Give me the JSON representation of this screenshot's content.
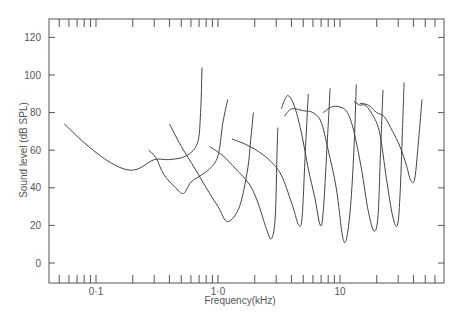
{
  "chart_data": {
    "type": "line",
    "title": "",
    "xlabel": "Frequency(kHz)",
    "ylabel": "Sound level (dB SPL)",
    "xscale": "log",
    "xlim": [
      0.045,
      60
    ],
    "ylim": [
      -10,
      130
    ],
    "x_tick_labels": [
      {
        "value": 0.1,
        "label": "0·1"
      },
      {
        "value": 1.0,
        "label": "1·0"
      },
      {
        "value": 10,
        "label": "10"
      }
    ],
    "y_ticks": [
      0,
      20,
      40,
      60,
      80,
      100,
      120
    ],
    "grid": false,
    "legend": null,
    "series": [
      {
        "name": "tuning-curve-1",
        "points": [
          [
            0.055,
            74
          ],
          [
            0.08,
            64
          ],
          [
            0.12,
            55
          ],
          [
            0.17,
            50
          ],
          [
            0.22,
            50
          ],
          [
            0.3,
            55
          ],
          [
            0.4,
            55
          ],
          [
            0.55,
            57
          ],
          [
            0.68,
            64
          ],
          [
            0.72,
            80
          ],
          [
            0.74,
            104
          ]
        ]
      },
      {
        "name": "tuning-curve-2",
        "points": [
          [
            0.27,
            60
          ],
          [
            0.31,
            56
          ],
          [
            0.36,
            47
          ],
          [
            0.45,
            40
          ],
          [
            0.52,
            37
          ],
          [
            0.6,
            43
          ],
          [
            0.7,
            46
          ],
          [
            0.85,
            50
          ],
          [
            1.0,
            57
          ],
          [
            1.1,
            75
          ],
          [
            1.2,
            87
          ]
        ]
      },
      {
        "name": "tuning-curve-3",
        "points": [
          [
            0.4,
            74
          ],
          [
            0.5,
            62
          ],
          [
            0.65,
            50
          ],
          [
            0.8,
            40
          ],
          [
            1.0,
            30
          ],
          [
            1.2,
            22
          ],
          [
            1.5,
            30
          ],
          [
            1.75,
            50
          ],
          [
            1.85,
            65
          ],
          [
            1.95,
            80
          ]
        ]
      },
      {
        "name": "tuning-curve-4",
        "points": [
          [
            0.85,
            62
          ],
          [
            1.1,
            57
          ],
          [
            1.4,
            50
          ],
          [
            1.8,
            42
          ],
          [
            2.1,
            33
          ],
          [
            2.5,
            18
          ],
          [
            2.75,
            13
          ],
          [
            2.95,
            25
          ],
          [
            3.05,
            60
          ],
          [
            3.1,
            72
          ]
        ]
      },
      {
        "name": "tuning-curve-5",
        "points": [
          [
            1.3,
            66
          ],
          [
            1.7,
            63
          ],
          [
            2.3,
            58
          ],
          [
            2.9,
            52
          ],
          [
            3.4,
            45
          ],
          [
            4.1,
            30
          ],
          [
            4.6,
            20
          ],
          [
            4.9,
            25
          ],
          [
            5.2,
            60
          ],
          [
            5.5,
            90
          ]
        ]
      },
      {
        "name": "tuning-curve-6",
        "points": [
          [
            3.3,
            82
          ],
          [
            3.7,
            89
          ],
          [
            4.2,
            84
          ],
          [
            4.8,
            70
          ],
          [
            5.5,
            50
          ],
          [
            6.2,
            35
          ],
          [
            6.9,
            20
          ],
          [
            7.3,
            28
          ],
          [
            7.8,
            60
          ],
          [
            8.3,
            93
          ]
        ]
      },
      {
        "name": "tuning-curve-7",
        "points": [
          [
            3.5,
            78
          ],
          [
            4.0,
            82
          ],
          [
            5.0,
            81
          ],
          [
            6.0,
            80
          ],
          [
            7.0,
            75
          ],
          [
            8.0,
            60
          ],
          [
            9.3,
            40
          ],
          [
            10.5,
            14
          ],
          [
            11.3,
            13
          ],
          [
            12.2,
            30
          ],
          [
            13.0,
            60
          ],
          [
            13.6,
            95
          ]
        ]
      },
      {
        "name": "tuning-curve-8",
        "points": [
          [
            7.3,
            80
          ],
          [
            8.5,
            83
          ],
          [
            10.0,
            83
          ],
          [
            11.5,
            80
          ],
          [
            13.0,
            70
          ],
          [
            15,
            50
          ],
          [
            17,
            28
          ],
          [
            19,
            17
          ],
          [
            20.5,
            25
          ],
          [
            21.5,
            60
          ],
          [
            22.5,
            92
          ]
        ]
      },
      {
        "name": "tuning-curve-9",
        "points": [
          [
            13.0,
            86
          ],
          [
            14.5,
            84
          ],
          [
            16,
            84
          ],
          [
            18,
            80
          ],
          [
            21,
            70
          ],
          [
            24,
            45
          ],
          [
            27,
            25
          ],
          [
            29.5,
            20
          ],
          [
            31,
            35
          ],
          [
            32.5,
            70
          ],
          [
            33.5,
            96
          ]
        ]
      },
      {
        "name": "tuning-curve-10",
        "points": [
          [
            14.5,
            85
          ],
          [
            17,
            84
          ],
          [
            20,
            80
          ],
          [
            23,
            78
          ],
          [
            27,
            70
          ],
          [
            31,
            62
          ],
          [
            35,
            52
          ],
          [
            38,
            44
          ],
          [
            41,
            45
          ],
          [
            44,
            65
          ],
          [
            47,
            87
          ]
        ]
      }
    ]
  }
}
